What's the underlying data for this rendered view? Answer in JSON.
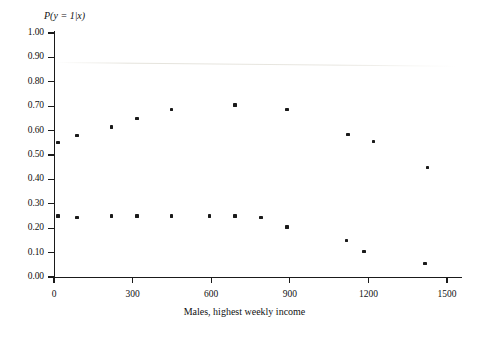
{
  "chart_data": {
    "type": "scatter",
    "title": "",
    "xlabel": "Males, highest weekly income",
    "ylabel": "P(y = 1|x)",
    "xlim": [
      -60,
      1560
    ],
    "ylim": [
      0.0,
      1.0
    ],
    "grid": false,
    "legend": "none",
    "xticks": [
      0,
      300,
      600,
      900,
      1200,
      1500
    ],
    "xtick_labels": [
      "0",
      "300",
      "600",
      "900",
      "1200",
      "1500"
    ],
    "yticks": [
      0.0,
      0.1,
      0.2,
      0.3,
      0.4,
      0.5,
      0.6,
      0.7,
      0.8,
      0.9,
      1.0
    ],
    "ytick_labels": [
      "0.00",
      "0.10",
      "0.20",
      "0.30",
      "0.40",
      "0.50",
      "0.60",
      "0.70",
      "0.80",
      "0.90",
      "1.00"
    ],
    "marker": "square",
    "marker_color": "#1a1a1a",
    "series": [
      {
        "name": "upper",
        "points": [
          {
            "x": 15,
            "y": 0.55
          },
          {
            "x": 88,
            "y": 0.58
          },
          {
            "x": 221,
            "y": 0.615
          },
          {
            "x": 317,
            "y": 0.65
          },
          {
            "x": 447,
            "y": 0.685
          },
          {
            "x": 691,
            "y": 0.705
          },
          {
            "x": 889,
            "y": 0.685
          },
          {
            "x": 1122,
            "y": 0.585
          },
          {
            "x": 1218,
            "y": 0.555
          },
          {
            "x": 1427,
            "y": 0.45
          }
        ]
      },
      {
        "name": "lower",
        "points": [
          {
            "x": 15,
            "y": 0.25
          },
          {
            "x": 88,
            "y": 0.245
          },
          {
            "x": 221,
            "y": 0.25
          },
          {
            "x": 317,
            "y": 0.25
          },
          {
            "x": 447,
            "y": 0.25
          },
          {
            "x": 592,
            "y": 0.25
          },
          {
            "x": 691,
            "y": 0.25
          },
          {
            "x": 790,
            "y": 0.245
          },
          {
            "x": 889,
            "y": 0.205
          },
          {
            "x": 1115,
            "y": 0.15
          },
          {
            "x": 1183,
            "y": 0.105
          },
          {
            "x": 1416,
            "y": 0.055
          }
        ]
      }
    ]
  }
}
